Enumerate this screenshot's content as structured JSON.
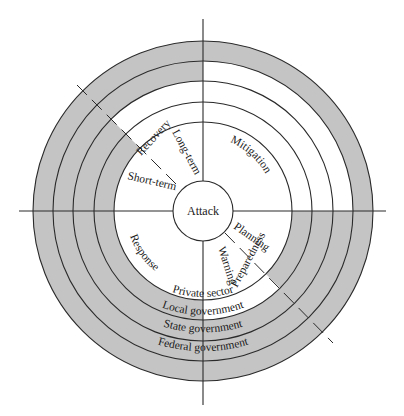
{
  "diagram": {
    "center": {
      "label": "Attack"
    },
    "phases": {
      "mitigation": "Mitigation",
      "planning": "Planning",
      "preparedness": "Preparedness",
      "warning": "Warning",
      "response": "Response",
      "short_term": "Short-term",
      "recovery": "Recovery",
      "long_term": "Long-term"
    },
    "rings": [
      {
        "id": "private",
        "label": "Private sector"
      },
      {
        "id": "local",
        "label": "Local government"
      },
      {
        "id": "state",
        "label": "State government"
      },
      {
        "id": "federal",
        "label": "Federal government"
      }
    ],
    "colors": {
      "shade": "#c4c4c4",
      "line": "#2a2a2a",
      "background": "#ffffff"
    }
  }
}
